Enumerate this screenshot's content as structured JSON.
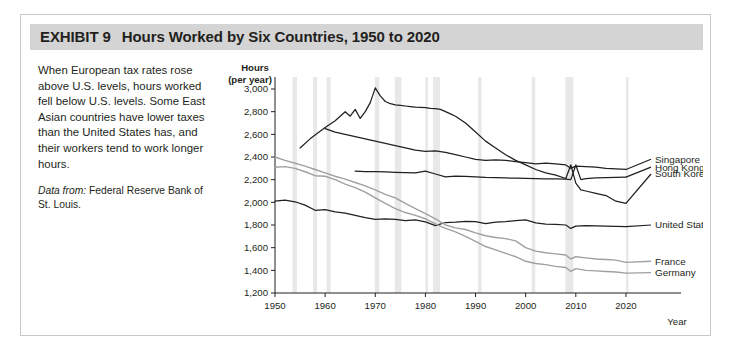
{
  "exhibit": {
    "number_label": "EXHIBIT 9",
    "title": "Hours Worked by Six Countries, 1950 to 2020"
  },
  "caption": {
    "body": "When European tax rates rose above U.S. levels, hours worked fell below U.S. levels. Some East Asian countries have lower taxes than the United States has, and their workers tend to work longer hours.",
    "source_lead": "Data from:",
    "source_text": "Federal Reserve Bank of St. Louis."
  },
  "colors": {
    "title_bar": "#d4d4d4",
    "frame_border": "#c8c8c8",
    "dark_line": "#231f20",
    "mid_line": "#595959",
    "light_line": "#a6a6a6",
    "recession_band": "#e8e8e8",
    "axis": "#231f20"
  },
  "chart_data": {
    "type": "line",
    "title": "Hours Worked by Six Countries, 1950 to 2020",
    "xlabel": "Year",
    "ylabel": "Hours (per year)",
    "ylabel_line1": "Hours",
    "ylabel_line2": "(per year)",
    "xlim": [
      1950,
      2023
    ],
    "ylim": [
      1200,
      3000
    ],
    "yticks": [
      1200,
      1400,
      1600,
      1800,
      2000,
      2200,
      2400,
      2600,
      2800,
      3000
    ],
    "ytick_labels": [
      "1,200",
      "1,400",
      "1,600",
      "1,800",
      "2,000",
      "2,200",
      "2,400",
      "2,600",
      "2,800",
      "3,000"
    ],
    "xticks": [
      1950,
      1960,
      1970,
      1980,
      1990,
      2000,
      2010,
      2020
    ],
    "xtick_labels": [
      "1950",
      "1960",
      "1970",
      "1980",
      "1990",
      "2000",
      "2010",
      "2020"
    ],
    "grid": false,
    "legend_position": "right-inline",
    "recession_bands": [
      [
        1953.5,
        1954.4
      ],
      [
        1957.6,
        1958.4
      ],
      [
        1960.3,
        1961.1
      ],
      [
        1969.9,
        1970.8
      ],
      [
        1973.9,
        1975.2
      ],
      [
        1980.0,
        1980.5
      ],
      [
        1981.5,
        1982.9
      ],
      [
        1990.5,
        1991.2
      ],
      [
        2001.2,
        2001.9
      ],
      [
        2007.9,
        2009.5
      ],
      [
        2020.0,
        2020.5
      ]
    ],
    "series": [
      {
        "name": "South Korea",
        "color": "#231f20",
        "width": 1.25,
        "label_y": 2250,
        "x": [
          1955,
          1957,
          1960,
          1962,
          1963,
          1964,
          1965,
          1966,
          1967,
          1968,
          1969,
          1970,
          1971,
          1972,
          1973,
          1974,
          1975,
          1976,
          1977,
          1978,
          1979,
          1980,
          1981,
          1982,
          1983,
          1984,
          1985,
          1986,
          1988,
          1990,
          1992,
          1994,
          1996,
          1998,
          2000,
          2002,
          2004,
          2006,
          2008,
          2009,
          2010,
          2011,
          2012,
          2014,
          2016,
          2018,
          2020
        ],
        "y": [
          2480,
          2560,
          2660,
          2720,
          2760,
          2800,
          2760,
          2820,
          2740,
          2800,
          2880,
          3010,
          2940,
          2890,
          2870,
          2860,
          2855,
          2850,
          2845,
          2840,
          2838,
          2835,
          2830,
          2826,
          2820,
          2800,
          2780,
          2760,
          2700,
          2620,
          2540,
          2480,
          2420,
          2370,
          2330,
          2290,
          2260,
          2240,
          2210,
          2330,
          2170,
          2110,
          2100,
          2080,
          2060,
          2010,
          1990
        ]
      },
      {
        "name": "Singapore",
        "color": "#231f20",
        "width": 1.25,
        "label_y": 2380,
        "x": [
          1960,
          1962,
          1964,
          1966,
          1968,
          1970,
          1972,
          1974,
          1976,
          1978,
          1980,
          1982,
          1984,
          1986,
          1988,
          1990,
          1992,
          1994,
          1996,
          1998,
          2000,
          2002,
          2004,
          2006,
          2008,
          2009,
          2010,
          2012,
          2014,
          2016,
          2018,
          2020
        ],
        "y": [
          2650,
          2620,
          2600,
          2580,
          2560,
          2540,
          2520,
          2500,
          2480,
          2460,
          2450,
          2455,
          2440,
          2420,
          2400,
          2380,
          2370,
          2375,
          2370,
          2360,
          2350,
          2340,
          2345,
          2340,
          2330,
          2300,
          2320,
          2315,
          2310,
          2300,
          2295,
          2290
        ]
      },
      {
        "name": "Hong Kong",
        "color": "#231f20",
        "width": 1.25,
        "label_y": 2310,
        "x": [
          1966,
          1968,
          1970,
          1972,
          1974,
          1976,
          1978,
          1980,
          1982,
          1984,
          1986,
          1988,
          1990,
          1992,
          1994,
          1996,
          1998,
          2000,
          2002,
          2004,
          2006,
          2008,
          2009,
          2010,
          2011,
          2012,
          2014,
          2016,
          2018,
          2020
        ],
        "y": [
          2275,
          2272,
          2270,
          2268,
          2265,
          2262,
          2260,
          2275,
          2250,
          2225,
          2232,
          2228,
          2225,
          2220,
          2218,
          2215,
          2213,
          2212,
          2210,
          2208,
          2206,
          2205,
          2200,
          2330,
          2200,
          2210,
          2215,
          2218,
          2220,
          2222
        ]
      },
      {
        "name": "United States",
        "color": "#231f20",
        "width": 1.25,
        "label_y": 1800,
        "x": [
          1950,
          1952,
          1954,
          1956,
          1958,
          1960,
          1962,
          1964,
          1966,
          1968,
          1970,
          1972,
          1974,
          1976,
          1978,
          1980,
          1982,
          1984,
          1986,
          1988,
          1990,
          1992,
          1994,
          1996,
          1998,
          2000,
          2002,
          2004,
          2006,
          2008,
          2009,
          2010,
          2012,
          2014,
          2016,
          2018,
          2020
        ],
        "y": [
          2010,
          2020,
          2005,
          1975,
          1930,
          1935,
          1915,
          1905,
          1885,
          1865,
          1850,
          1855,
          1850,
          1838,
          1845,
          1828,
          1795,
          1822,
          1825,
          1832,
          1830,
          1812,
          1825,
          1830,
          1838,
          1845,
          1818,
          1808,
          1805,
          1800,
          1770,
          1790,
          1795,
          1792,
          1790,
          1788,
          1785
        ]
      },
      {
        "name": "France",
        "color": "#a0a0a0",
        "width": 1.4,
        "label_y": 1480,
        "x": [
          1950,
          1952,
          1954,
          1956,
          1958,
          1960,
          1962,
          1964,
          1966,
          1968,
          1970,
          1972,
          1974,
          1976,
          1978,
          1980,
          1982,
          1984,
          1986,
          1988,
          1990,
          1992,
          1994,
          1996,
          1998,
          2000,
          2002,
          2004,
          2006,
          2008,
          2009,
          2010,
          2012,
          2014,
          2016,
          2018,
          2020
        ],
        "y": [
          2400,
          2370,
          2345,
          2320,
          2290,
          2260,
          2230,
          2205,
          2175,
          2145,
          2110,
          2070,
          2040,
          1990,
          1945,
          1900,
          1855,
          1800,
          1775,
          1760,
          1730,
          1705,
          1690,
          1680,
          1660,
          1600,
          1570,
          1555,
          1545,
          1535,
          1500,
          1520,
          1510,
          1500,
          1495,
          1490,
          1470
        ]
      },
      {
        "name": "Germany",
        "color": "#a0a0a0",
        "width": 1.4,
        "label_y": 1380,
        "x": [
          1950,
          1952,
          1954,
          1956,
          1958,
          1960,
          1962,
          1964,
          1966,
          1968,
          1970,
          1972,
          1974,
          1976,
          1978,
          1980,
          1982,
          1984,
          1986,
          1988,
          1990,
          1992,
          1994,
          1996,
          1998,
          2000,
          2002,
          2004,
          2006,
          2008,
          2009,
          2010,
          2012,
          2014,
          2016,
          2018,
          2020
        ],
        "y": [
          2310,
          2315,
          2300,
          2270,
          2235,
          2230,
          2200,
          2160,
          2130,
          2090,
          2040,
          1990,
          1945,
          1910,
          1885,
          1855,
          1810,
          1770,
          1740,
          1700,
          1655,
          1610,
          1580,
          1550,
          1520,
          1480,
          1460,
          1450,
          1435,
          1425,
          1390,
          1415,
          1400,
          1395,
          1390,
          1385,
          1375
        ]
      }
    ]
  }
}
